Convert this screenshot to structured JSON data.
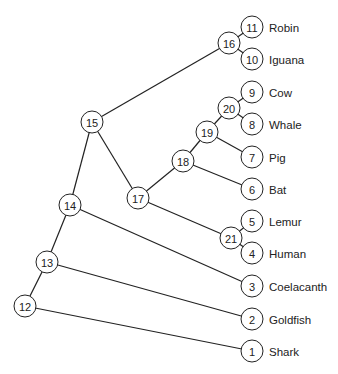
{
  "diagram": {
    "type": "phylogenetic-tree",
    "colors": {
      "line": "#222222",
      "background": "#ffffff",
      "node_fill": "#ffffff"
    },
    "nodes": [
      {
        "id": "1",
        "label": "Shark",
        "x": 252,
        "y": 351,
        "leaf": true
      },
      {
        "id": "2",
        "label": "Goldfish",
        "x": 252,
        "y": 319,
        "leaf": true
      },
      {
        "id": "3",
        "label": "Coelacanth",
        "x": 252,
        "y": 286,
        "leaf": true
      },
      {
        "id": "4",
        "label": "Human",
        "x": 252,
        "y": 253,
        "leaf": true
      },
      {
        "id": "5",
        "label": "Lemur",
        "x": 252,
        "y": 221,
        "leaf": true
      },
      {
        "id": "6",
        "label": "Bat",
        "x": 252,
        "y": 189,
        "leaf": true
      },
      {
        "id": "7",
        "label": "Pig",
        "x": 252,
        "y": 157,
        "leaf": true
      },
      {
        "id": "8",
        "label": "Whale",
        "x": 252,
        "y": 124,
        "leaf": true
      },
      {
        "id": "9",
        "label": "Cow",
        "x": 252,
        "y": 92,
        "leaf": true
      },
      {
        "id": "10",
        "label": "Iguana",
        "x": 252,
        "y": 59,
        "leaf": true
      },
      {
        "id": "11",
        "label": "Robin",
        "x": 252,
        "y": 27,
        "leaf": true
      },
      {
        "id": "12",
        "label": "",
        "x": 25,
        "y": 306,
        "leaf": false
      },
      {
        "id": "13",
        "label": "",
        "x": 47,
        "y": 262,
        "leaf": false
      },
      {
        "id": "14",
        "label": "",
        "x": 70,
        "y": 205,
        "leaf": false
      },
      {
        "id": "15",
        "label": "",
        "x": 92,
        "y": 122,
        "leaf": false
      },
      {
        "id": "16",
        "label": "",
        "x": 229,
        "y": 43,
        "leaf": false
      },
      {
        "id": "17",
        "label": "",
        "x": 138,
        "y": 198,
        "leaf": false
      },
      {
        "id": "18",
        "label": "",
        "x": 183,
        "y": 161,
        "leaf": false
      },
      {
        "id": "19",
        "label": "",
        "x": 207,
        "y": 132,
        "leaf": false
      },
      {
        "id": "20",
        "label": "",
        "x": 229,
        "y": 108,
        "leaf": false
      },
      {
        "id": "21",
        "label": "",
        "x": 231,
        "y": 238,
        "leaf": false
      }
    ],
    "edges": [
      [
        "12",
        "1"
      ],
      [
        "12",
        "13"
      ],
      [
        "13",
        "2"
      ],
      [
        "13",
        "14"
      ],
      [
        "14",
        "3"
      ],
      [
        "14",
        "15"
      ],
      [
        "15",
        "16"
      ],
      [
        "15",
        "17"
      ],
      [
        "16",
        "11"
      ],
      [
        "16",
        "10"
      ],
      [
        "17",
        "18"
      ],
      [
        "17",
        "21"
      ],
      [
        "18",
        "19"
      ],
      [
        "18",
        "6"
      ],
      [
        "19",
        "20"
      ],
      [
        "19",
        "7"
      ],
      [
        "20",
        "9"
      ],
      [
        "20",
        "8"
      ],
      [
        "21",
        "5"
      ],
      [
        "21",
        "4"
      ]
    ]
  }
}
